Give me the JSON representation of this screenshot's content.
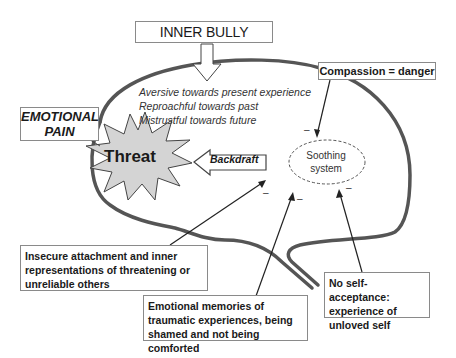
{
  "inner_bully": {
    "label": "INNER BULLY",
    "traits": [
      "Aversive towards present experience",
      "Reproachful towards past",
      "Mistrustful towards future"
    ]
  },
  "emotional_pain": {
    "line1": "EMOTIONAL",
    "line2": "PAIN"
  },
  "threat": {
    "label": "Threat"
  },
  "backdraft": {
    "label": "Backdraft"
  },
  "soothing": {
    "line1": "Soothing",
    "line2": "system"
  },
  "compassion": {
    "label": "Compassion = danger"
  },
  "inputs": {
    "insecure_attachment": "Insecure attachment and inner representations of threatening or unreliable others",
    "emotional_memories": "Emotional memories of traumatic experiences, being shamed and not being comforted",
    "no_self_acceptance": "No self-acceptance: experience of unloved self"
  },
  "signs": {
    "minus": "–"
  },
  "colors": {
    "head_outline": "#555555",
    "starburst_fill": "#d4d4d4",
    "box_border": "#8a8a8a"
  }
}
